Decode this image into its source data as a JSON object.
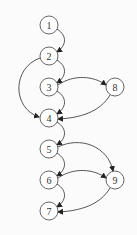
{
  "diagram": {
    "type": "control-flow-graph",
    "nodes": [
      {
        "id": "1",
        "label": "1",
        "x": 49,
        "y": 25
      },
      {
        "id": "2",
        "label": "2",
        "x": 49,
        "y": 56
      },
      {
        "id": "3",
        "label": "3",
        "x": 49,
        "y": 87
      },
      {
        "id": "8",
        "label": "8",
        "x": 115,
        "y": 87
      },
      {
        "id": "4",
        "label": "4",
        "x": 49,
        "y": 118
      },
      {
        "id": "5",
        "label": "5",
        "x": 49,
        "y": 149
      },
      {
        "id": "6",
        "label": "6",
        "x": 49,
        "y": 180
      },
      {
        "id": "9",
        "label": "9",
        "x": 115,
        "y": 180
      },
      {
        "id": "7",
        "label": "7",
        "x": 49,
        "y": 211
      }
    ],
    "edges": [
      {
        "from": "1",
        "to": "2"
      },
      {
        "from": "2",
        "to": "3"
      },
      {
        "from": "2",
        "to": "4"
      },
      {
        "from": "3",
        "to": "8"
      },
      {
        "from": "3",
        "to": "4"
      },
      {
        "from": "8",
        "to": "4"
      },
      {
        "from": "4",
        "to": "5"
      },
      {
        "from": "5",
        "to": "6"
      },
      {
        "from": "5",
        "to": "9"
      },
      {
        "from": "6",
        "to": "9"
      },
      {
        "from": "6",
        "to": "7"
      },
      {
        "from": "9",
        "to": "7"
      }
    ]
  }
}
